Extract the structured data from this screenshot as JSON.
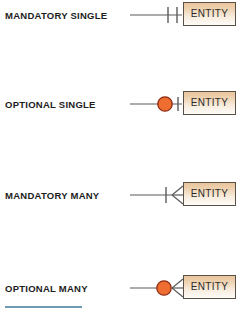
{
  "diagram": {
    "entity_label": "ENTITY",
    "colors": {
      "entity_fill_top": "#e9c49b",
      "entity_fill_bottom": "#fdfbf8",
      "entity_border": "#5a5146",
      "line": "#5b5b5b",
      "optional_circle_fill": "#ef6d30",
      "optional_circle_border": "#8c2a12",
      "label_text": "#1d1d1d",
      "footer_rule": "#6f9ab2"
    },
    "rows": [
      {
        "label": "MANDATORY SINGLE",
        "symbol": "one-mandatory",
        "symbol_parts": [
          "tick",
          "tick"
        ],
        "cardinality": "exactly one",
        "entity": "ENTITY"
      },
      {
        "label": "OPTIONAL SINGLE",
        "symbol": "one-optional",
        "symbol_parts": [
          "circle",
          "tick"
        ],
        "cardinality": "zero or one",
        "entity": "ENTITY"
      },
      {
        "label": "MANDATORY MANY",
        "symbol": "many-mandatory",
        "symbol_parts": [
          "tick",
          "crowsfoot"
        ],
        "cardinality": "one or many",
        "entity": "ENTITY"
      },
      {
        "label": "OPTIONAL MANY",
        "symbol": "many-optional",
        "symbol_parts": [
          "circle",
          "crowsfoot"
        ],
        "cardinality": "zero or many",
        "entity": "ENTITY"
      }
    ]
  }
}
